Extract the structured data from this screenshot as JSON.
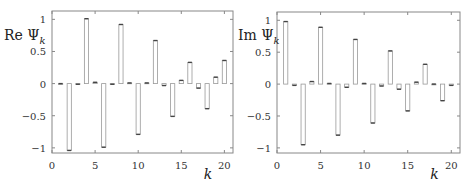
{
  "chart_data": [
    {
      "type": "bar",
      "title": "",
      "ylabel": "Re Ψ_k",
      "ylabel_main": "Re Ψ",
      "ylabel_sub": "k",
      "xlabel": "k",
      "x": [
        1,
        2,
        3,
        4,
        5,
        6,
        7,
        8,
        9,
        10,
        11,
        12,
        13,
        14,
        15,
        16,
        17,
        18,
        19,
        20
      ],
      "values": [
        0.0,
        -1.04,
        -0.01,
        1.01,
        0.02,
        -0.99,
        -0.01,
        0.92,
        0.01,
        -0.79,
        0.01,
        0.67,
        -0.03,
        -0.51,
        0.05,
        0.33,
        -0.07,
        -0.39,
        0.1,
        0.36
      ],
      "xlim": [
        0,
        21
      ],
      "ylim": [
        -1.1,
        1.1
      ],
      "xticks": [
        0,
        5,
        10,
        15,
        20
      ],
      "yticks": [
        -1,
        -0.5,
        0,
        0.5,
        1
      ],
      "ytick_labels": [
        "−1",
        "−0.5",
        "0",
        "0.5",
        "1"
      ],
      "grid": false,
      "legend": null
    },
    {
      "type": "bar",
      "title": "",
      "ylabel": "Im Ψ_k",
      "ylabel_main": "Im Ψ",
      "ylabel_sub": "k",
      "xlabel": "k",
      "x": [
        1,
        2,
        3,
        4,
        5,
        6,
        7,
        8,
        9,
        10,
        11,
        12,
        13,
        14,
        15,
        16,
        17,
        18,
        19,
        20
      ],
      "values": [
        0.98,
        -0.02,
        -0.95,
        0.04,
        0.89,
        0.01,
        -0.8,
        -0.05,
        0.7,
        0.01,
        -0.61,
        -0.03,
        0.52,
        -0.08,
        -0.42,
        0.03,
        0.31,
        0.0,
        -0.26,
        -0.02
      ],
      "xlim": [
        0,
        21
      ],
      "ylim": [
        -1.1,
        1.1
      ],
      "xticks": [
        0,
        5,
        10,
        15,
        20
      ],
      "yticks": [
        -1,
        -0.5,
        0,
        0.5,
        1
      ],
      "ytick_labels": [
        "−1",
        "−0.5",
        "0",
        "0.5",
        "1"
      ],
      "grid": false,
      "legend": null
    }
  ],
  "colors": {
    "frame": "#888888",
    "bar_stroke": "#999999",
    "bar_fill": "#ffffff",
    "marker": "#444444",
    "text": "#333333"
  }
}
